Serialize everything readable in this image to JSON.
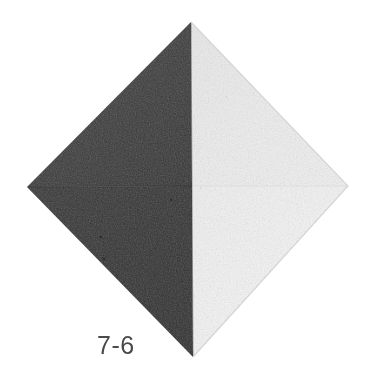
{
  "figure": {
    "caption": "7-6",
    "background_color": "#ffffff",
    "caption_color": "#4a4a4a"
  },
  "chart_data": {
    "type": "diagram",
    "title": "7-6",
    "subtitle": "",
    "xlabel": "",
    "ylabel": "",
    "geometry": {
      "shape": "square-bipyramid-octahedron",
      "vertices": {
        "top": [
          191,
          22
        ],
        "left": [
          27,
          187
        ],
        "right": [
          348,
          186
        ],
        "bottom": [
          193,
          357
        ],
        "center": [
          192,
          186
        ]
      },
      "width_px": 321,
      "height_px": 335
    },
    "faces": [
      {
        "name": "upper-left-face",
        "tone": "dark",
        "fill": "#3b3b3b",
        "points": "191,22 192,186 27,187"
      },
      {
        "name": "lower-left-face",
        "tone": "dark",
        "fill": "#333333",
        "points": "27,187 192,186 193,357"
      },
      {
        "name": "upper-right-face",
        "tone": "light",
        "fill": "#ededed",
        "points": "191,22 348,186 192,186"
      },
      {
        "name": "lower-right-face",
        "tone": "light",
        "fill": "#f3f3f3",
        "points": "192,186 348,186 193,357"
      }
    ],
    "edges": [
      {
        "name": "vertical-ridge",
        "from": "top",
        "to": "bottom",
        "contrast": "high"
      },
      {
        "name": "horizontal-girdle",
        "from": "left",
        "to": "right",
        "contrast": "low"
      }
    ],
    "legend": [],
    "annotations": [
      "7-6"
    ]
  }
}
